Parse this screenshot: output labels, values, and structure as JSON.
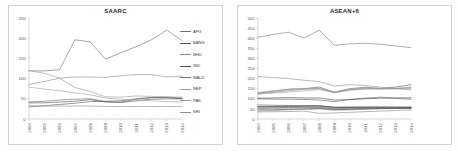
{
  "figure": {
    "background": "#fdfdfd",
    "panel_count": 2
  },
  "chart_data": [
    {
      "type": "line",
      "title": "SAARC",
      "xlabel": "",
      "ylabel": "",
      "x": [
        "2004",
        "2005",
        "2006",
        "2007",
        "2008",
        "2009",
        "2010",
        "2011",
        "2012",
        "2013",
        "2014"
      ],
      "ylim": [
        0,
        250
      ],
      "yticks": [
        0,
        50,
        100,
        150,
        200,
        250
      ],
      "grid": false,
      "legend_position": "right",
      "series": [
        {
          "name": "AFG",
          "color": "#6f6f6f",
          "values": [
            42,
            44,
            47,
            49,
            50,
            43,
            42,
            49,
            53,
            54,
            52
          ]
        },
        {
          "name": "BANG",
          "color": "#595959",
          "values": [
            30,
            33,
            36,
            39,
            43,
            44,
            45,
            50,
            53,
            53,
            50
          ]
        },
        {
          "name": "BHU",
          "color": "#8a8a8a",
          "values": [
            85,
            93,
            101,
            104,
            104,
            103,
            107,
            110,
            110,
            104,
            106
          ]
        },
        {
          "name": "IND",
          "color": "#4f4f4f",
          "values": [
            40,
            40,
            42,
            44,
            48,
            42,
            41,
            45,
            49,
            50,
            50
          ]
        },
        {
          "name": "MALD",
          "color": "#707070",
          "values": [
            119,
            119,
            122,
            196,
            191,
            148,
            164,
            179,
            196,
            220,
            194
          ]
        },
        {
          "name": "NEP",
          "color": "#9a9a9a",
          "values": [
            120,
            113,
            101,
            78,
            68,
            55,
            54,
            57,
            56,
            55,
            54
          ]
        },
        {
          "name": "PAK",
          "color": "#9e9e9e",
          "values": [
            79,
            74,
            70,
            65,
            60,
            52,
            49,
            47,
            45,
            43,
            42
          ]
        },
        {
          "name": "SRI",
          "color": "#8f8f8f",
          "values": [
            33,
            32,
            32,
            32,
            32,
            31,
            31,
            31,
            31,
            31,
            31
          ]
        }
      ]
    },
    {
      "type": "line",
      "title": "ASEAN+6",
      "xlabel": "",
      "ylabel": "",
      "x": [
        "2004",
        "2005",
        "2006",
        "2007",
        "2008",
        "2009",
        "2010",
        "2011",
        "2012",
        "2013",
        "2014"
      ],
      "ylim": [
        0,
        500
      ],
      "yticks": [
        0,
        50,
        100,
        150,
        200,
        250,
        300,
        350,
        400,
        450,
        500
      ],
      "grid": false,
      "legend_position": "right",
      "series": [
        {
          "name": "AUS",
          "color": "#7a7a7a",
          "values": [
            405,
            418,
            430,
            400,
            440,
            365,
            372,
            375,
            370,
            362,
            353
          ]
        },
        {
          "name": "BRU",
          "color": "#5a5a5a",
          "values": [
            128,
            137,
            148,
            150,
            158,
            133,
            150,
            157,
            152,
            158,
            170
          ]
        },
        {
          "name": "CAM",
          "color": "#9c9c9c",
          "values": [
            40,
            42,
            45,
            47,
            50,
            43,
            45,
            48,
            52,
            55,
            57
          ]
        },
        {
          "name": "CHI",
          "color": "#484848",
          "values": [
            103,
            104,
            106,
            104,
            104,
            94,
            96,
            100,
            103,
            104,
            105
          ]
        },
        {
          "name": "IND",
          "color": "#3f3f3f",
          "values": [
            60,
            61,
            62,
            63,
            64,
            57,
            57,
            58,
            58,
            57,
            57
          ]
        },
        {
          "name": "IDN",
          "color": "#6b6b6b",
          "values": [
            55,
            56,
            57,
            58,
            59,
            52,
            53,
            54,
            55,
            55,
            55
          ]
        },
        {
          "name": "JAP",
          "color": "#8d8d8d",
          "values": [
            210,
            205,
            200,
            192,
            185,
            163,
            170,
            166,
            158,
            150,
            145
          ]
        },
        {
          "name": "KOR",
          "color": "#a5a5a5",
          "values": [
            123,
            128,
            134,
            139,
            145,
            130,
            141,
            148,
            150,
            150,
            152
          ]
        },
        {
          "name": "LAO",
          "color": "#8a8a8a",
          "values": [
            35,
            36,
            37,
            39,
            28,
            30,
            33,
            36,
            39,
            42,
            45
          ]
        },
        {
          "name": "MYS",
          "color": "#9f9f9f",
          "values": [
            132,
            140,
            146,
            150,
            152,
            133,
            148,
            152,
            150,
            152,
            158
          ]
        },
        {
          "name": "MYAR",
          "color": "#767676",
          "values": [
            52,
            53,
            54,
            55,
            56,
            50,
            51,
            52,
            53,
            53,
            54
          ]
        },
        {
          "name": "NZ",
          "color": "#5f5f5f",
          "values": [
            100,
            98,
            98,
            97,
            94,
            86,
            97,
            104,
            108,
            102,
            98
          ]
        },
        {
          "name": "PHLP",
          "color": "#6e6e6e",
          "values": [
            70,
            68,
            67,
            66,
            64,
            58,
            58,
            57,
            56,
            55,
            54
          ]
        },
        {
          "name": "SING",
          "color": "#888888",
          "values": [
            125,
            132,
            140,
            147,
            150,
            131,
            145,
            150,
            148,
            150,
            155
          ]
        },
        {
          "name": "THAI",
          "color": "#555555",
          "values": [
            62,
            63,
            64,
            65,
            66,
            58,
            59,
            60,
            60,
            60,
            60
          ]
        },
        {
          "name": "VIET",
          "color": "#4a4a4a",
          "values": [
            45,
            46,
            48,
            50,
            52,
            46,
            48,
            50,
            51,
            52,
            53
          ]
        }
      ]
    }
  ]
}
